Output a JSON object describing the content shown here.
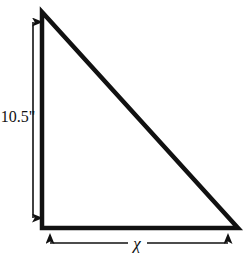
{
  "figure": {
    "background_color": "#ffffff",
    "stroke_color": "#111111",
    "shape": {
      "name": "right-triangle",
      "apex": [
        42,
        12
      ],
      "bottom_left": [
        42,
        228
      ],
      "bottom_right": [
        238,
        228
      ],
      "stroke_width": 4.5
    },
    "dimensions": {
      "height": {
        "label": "10.5\"",
        "value": 10.5,
        "unit": "inches",
        "orientation": "vertical",
        "arrow_x": 33,
        "arrow_y_top": 12,
        "arrow_y_bottom": 228,
        "label_x": 18,
        "label_y": 118
      },
      "base": {
        "label": "χ",
        "value": null,
        "unit": "",
        "orientation": "horizontal",
        "arrow_y": 243,
        "arrow_x_left": 40,
        "arrow_x_right": 238,
        "label_x": 137,
        "label_y": 249
      }
    },
    "line_widths": {
      "dimension_line": 1.6
    }
  }
}
